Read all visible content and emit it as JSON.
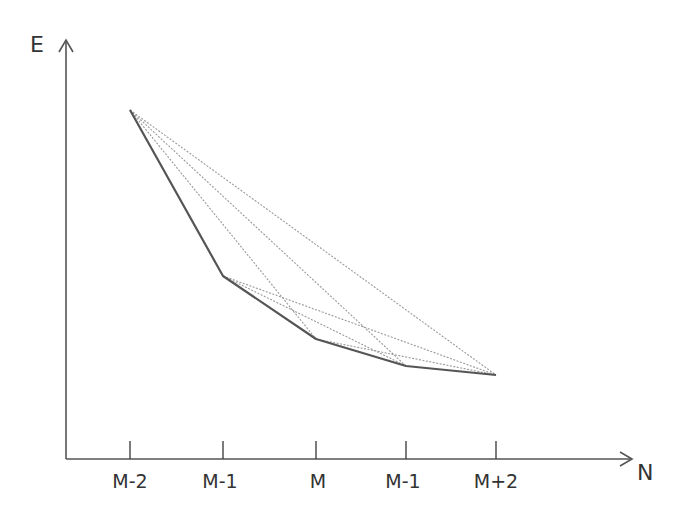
{
  "diagram": {
    "y_axis_label": "E",
    "x_axis_label": "N",
    "tick_labels": [
      "M-2",
      "M-1",
      "M",
      "M-1",
      "M+2"
    ],
    "colors": {
      "axis": "#555555",
      "curve": "#555555",
      "chords": "#9a9a9a",
      "text": "#333333"
    },
    "points": [
      {
        "label": "M-2",
        "x": 130,
        "y": 110
      },
      {
        "label": "M-1",
        "x": 223,
        "y": 276
      },
      {
        "label": "M",
        "x": 316,
        "y": 339
      },
      {
        "label": "M-1",
        "x": 406,
        "y": 366
      },
      {
        "label": "M+2",
        "x": 496,
        "y": 375
      }
    ],
    "solid_polyline": "Energy vs N (convex piecewise-linear)",
    "dotted_chords": [
      [
        0,
        2
      ],
      [
        0,
        3
      ],
      [
        0,
        4
      ],
      [
        1,
        3
      ],
      [
        1,
        4
      ],
      [
        2,
        4
      ]
    ]
  }
}
